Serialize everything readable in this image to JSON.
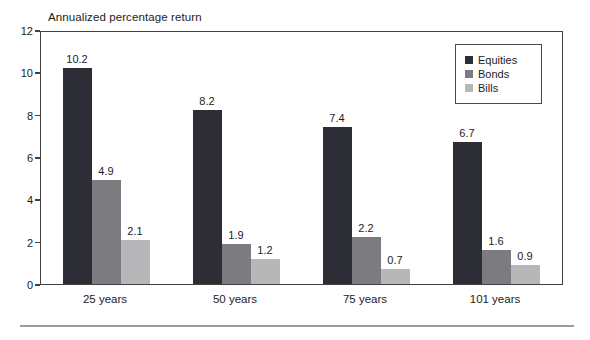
{
  "title": "Annualized percentage return",
  "colors": {
    "equities": "#2d2d35",
    "bonds": "#7c7c80",
    "bills": "#b7b7ba",
    "axis": "#404040",
    "text": "#1c1c1c",
    "bottom_rule": "#9b9b9b"
  },
  "legend": {
    "items": [
      "Equities",
      "Bonds",
      "Bills"
    ]
  },
  "chart_data": {
    "type": "bar",
    "title": "Annualized percentage return",
    "categories": [
      "25 years",
      "50 years",
      "75 years",
      "101 years"
    ],
    "series": [
      {
        "name": "Equities",
        "color": "#2d2d35",
        "values": [
          10.2,
          8.2,
          7.4,
          6.7
        ]
      },
      {
        "name": "Bonds",
        "color": "#7c7c80",
        "values": [
          4.9,
          1.9,
          2.2,
          1.6
        ]
      },
      {
        "name": "Bills",
        "color": "#b7b7ba",
        "values": [
          2.1,
          1.2,
          0.7,
          0.9
        ]
      }
    ],
    "xlabel": "",
    "ylabel": "Annualized percentage return",
    "ylim": [
      0,
      12
    ],
    "yticks": [
      0,
      2,
      4,
      6,
      8,
      10,
      12
    ],
    "grid": false,
    "data_labels": true,
    "legend_position": "top-right"
  }
}
